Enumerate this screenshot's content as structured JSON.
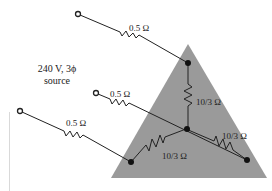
{
  "diagram": {
    "source_label_line1": "240 V, 3ϕ",
    "source_label_line2": "source",
    "line_resistors": [
      {
        "label": "0.5 Ω"
      },
      {
        "label": "0.5 Ω"
      },
      {
        "label": "0.5 Ω"
      }
    ],
    "load_resistors": [
      {
        "label": "10/3 Ω"
      },
      {
        "label": "10/3 Ω"
      },
      {
        "label": "10/3 Ω"
      }
    ],
    "colors": {
      "load_triangle": "#9a9a9a",
      "wire": "#222222",
      "background": "#ffffff"
    }
  }
}
